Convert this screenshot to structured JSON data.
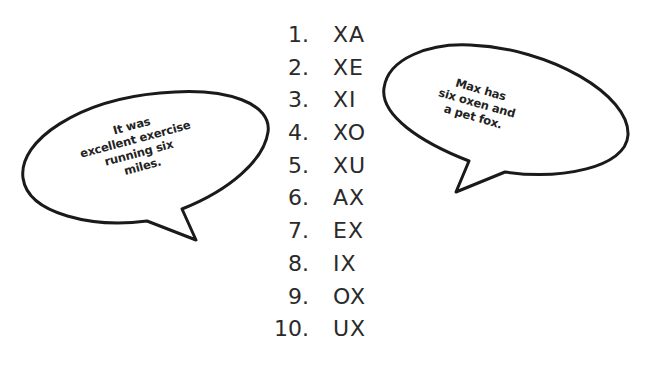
{
  "list": {
    "items": [
      {
        "number": "1.",
        "text": "XA"
      },
      {
        "number": "2.",
        "text": "XE"
      },
      {
        "number": "3.",
        "text": "XI"
      },
      {
        "number": "4.",
        "text": "XO"
      },
      {
        "number": "5.",
        "text": "XU"
      },
      {
        "number": "6.",
        "text": "AX"
      },
      {
        "number": "7.",
        "text": "EX"
      },
      {
        "number": "8.",
        "text": "IX"
      },
      {
        "number": "9.",
        "text": "OX"
      },
      {
        "number": "10.",
        "text": "UX"
      }
    ]
  },
  "bubbles": {
    "left": {
      "lines": [
        "It was",
        "excellent exercise",
        "running six",
        "miles."
      ]
    },
    "right": {
      "lines": [
        "Max has",
        "six oxen and",
        "a pet fox."
      ]
    }
  },
  "colors": {
    "ink": "#1a1a1a",
    "text": "#2a2a2a",
    "background": "#ffffff"
  }
}
